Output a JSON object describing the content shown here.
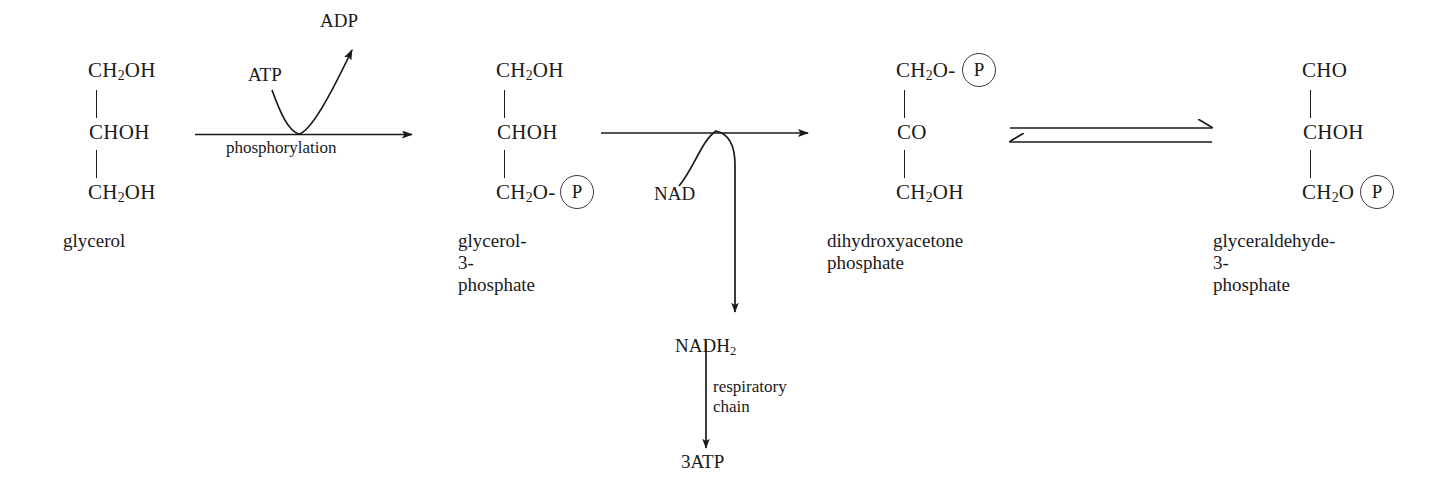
{
  "diagram": {
    "ink_color": "#1a1a1a",
    "background": "#ffffff"
  },
  "structures": [
    {
      "id": "glycerol",
      "caption": "glycerol",
      "lines": [
        "CH2OH",
        "CHOH",
        "CH2OH"
      ],
      "line_top": "CH",
      "line_top_sub": "2",
      "line_top_rest": "OH",
      "line_mid": "CHOH",
      "line_bot": "CH",
      "line_bot_sub": "2",
      "line_bot_rest": "OH",
      "has_phosphate": false
    },
    {
      "id": "glycerol-3-phosphate",
      "caption": "glycerol-3-\nphosphate",
      "line_top": "CH",
      "line_top_sub": "2",
      "line_top_rest": "OH",
      "line_mid": "CHOH",
      "line_bot": "CH",
      "line_bot_sub": "2",
      "line_bot_rest": "O-",
      "has_phosphate": true,
      "phosphate_label": "P"
    },
    {
      "id": "dihydroxyacetone-phosphate",
      "caption": "dihydroxyacetone\nphosphate",
      "line_top": "CH",
      "line_top_sub": "2",
      "line_top_rest": "O-",
      "line_mid": "CO",
      "line_bot": "CH",
      "line_bot_sub": "2",
      "line_bot_rest": "OH",
      "has_phosphate": true,
      "phosphate_label": "P"
    },
    {
      "id": "glyceraldehyde-3-phosphate",
      "caption": "glyceraldehyde-3-\nphosphate",
      "line_top": "CHO",
      "line_top_sub": "",
      "line_top_rest": "",
      "line_mid": "CHOH",
      "line_bot": "CH",
      "line_bot_sub": "2",
      "line_bot_rest": "O",
      "has_phosphate": true,
      "phosphate_label": "P"
    }
  ],
  "reactions": {
    "phosphorylation": {
      "label": "phosphorylation",
      "cofactor_in": "ATP",
      "cofactor_out": "ADP"
    },
    "oxidation": {
      "cofactor_in": "NAD",
      "product": "NADH",
      "product_sub": "2"
    },
    "isomerization": {
      "type": "equilibrium",
      "label": ""
    },
    "respiration": {
      "label": "respiratory\nchain",
      "product": "3ATP"
    }
  }
}
